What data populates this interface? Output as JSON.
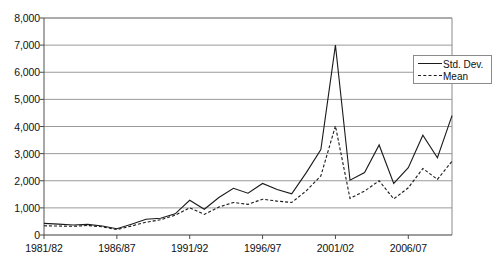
{
  "chart_data": {
    "type": "line",
    "title": "",
    "subtitle": "",
    "xlabel": "",
    "ylabel": "",
    "grid": true,
    "legend_position": "top-right",
    "ylim": [
      0,
      8000
    ],
    "ytick_labels": [
      "8,000",
      "7,000",
      "6,000",
      "5,000",
      "4,000",
      "3,000",
      "2,000",
      "1,000",
      "0"
    ],
    "ytick_values": [
      8000,
      7000,
      6000,
      5000,
      4000,
      3000,
      2000,
      1000,
      0
    ],
    "xtick_labels": [
      "1981/82",
      "1986/87",
      "1991/92",
      "1996/97",
      "2001/02",
      "2006/07"
    ],
    "xtick_indices": [
      0,
      5,
      10,
      15,
      20,
      25
    ],
    "x": [
      "1981/82",
      "1982/83",
      "1983/84",
      "1984/85",
      "1985/86",
      "1986/87",
      "1987/88",
      "1988/89",
      "1989/90",
      "1990/91",
      "1991/92",
      "1992/93",
      "1993/94",
      "1994/95",
      "1995/96",
      "1996/97",
      "1997/98",
      "1998/99",
      "1999/00",
      "2000/01",
      "2001/02",
      "2002/03",
      "2003/04",
      "2004/05",
      "2005/06",
      "2006/07",
      "2007/08",
      "2008/09",
      "2009/10"
    ],
    "series": [
      {
        "name": "Std. Dev.",
        "style": "solid",
        "color": "#1a1a1a",
        "values": [
          430,
          400,
          370,
          390,
          330,
          230,
          400,
          580,
          620,
          780,
          1280,
          950,
          1380,
          1720,
          1540,
          1900,
          1680,
          1520,
          2300,
          3150,
          7000,
          2020,
          2300,
          3320,
          1900,
          2480,
          3680,
          2850,
          4400
        ]
      },
      {
        "name": "Mean",
        "style": "dashed",
        "color": "#1a1a1a",
        "values": [
          340,
          330,
          320,
          350,
          300,
          200,
          330,
          470,
          560,
          730,
          1000,
          760,
          1030,
          1200,
          1130,
          1320,
          1250,
          1200,
          1630,
          2180,
          4020,
          1350,
          1620,
          2000,
          1330,
          1740,
          2450,
          2050,
          2720
        ]
      }
    ]
  }
}
